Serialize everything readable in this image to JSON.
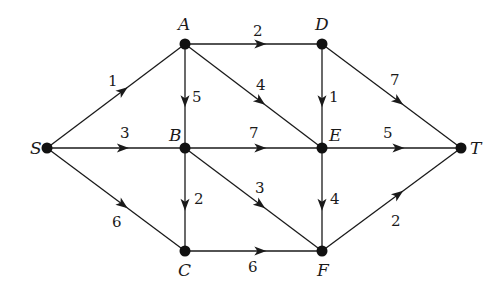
{
  "diagram": {
    "type": "directed-weighted-network",
    "nodes": [
      {
        "id": "S",
        "label": "S",
        "x": 47,
        "y": 148,
        "lx": 30,
        "ly": 154
      },
      {
        "id": "A",
        "label": "A",
        "x": 185,
        "y": 44,
        "lx": 178,
        "ly": 30
      },
      {
        "id": "B",
        "label": "B",
        "x": 185,
        "y": 148,
        "lx": 169,
        "ly": 141
      },
      {
        "id": "C",
        "label": "C",
        "x": 185,
        "y": 251,
        "lx": 178,
        "ly": 276
      },
      {
        "id": "D",
        "label": "D",
        "x": 322,
        "y": 44,
        "lx": 315,
        "ly": 30
      },
      {
        "id": "E",
        "label": "E",
        "x": 322,
        "y": 148,
        "lx": 329,
        "ly": 141
      },
      {
        "id": "F",
        "label": "F",
        "x": 322,
        "y": 251,
        "lx": 317,
        "ly": 276
      },
      {
        "id": "T",
        "label": "T",
        "x": 461,
        "y": 148,
        "lx": 470,
        "ly": 154
      }
    ],
    "edges": [
      {
        "from": "S",
        "to": "A",
        "weight": "1",
        "wx": 108,
        "wy": 86
      },
      {
        "from": "S",
        "to": "B",
        "weight": "3",
        "wx": 120,
        "wy": 138
      },
      {
        "from": "S",
        "to": "C",
        "weight": "6",
        "wx": 112,
        "wy": 227
      },
      {
        "from": "A",
        "to": "D",
        "weight": "2",
        "wx": 253,
        "wy": 36
      },
      {
        "from": "A",
        "to": "B",
        "weight": "5",
        "wx": 192,
        "wy": 102
      },
      {
        "from": "A",
        "to": "E",
        "weight": "4",
        "wx": 256,
        "wy": 90
      },
      {
        "from": "B",
        "to": "E",
        "weight": "7",
        "wx": 249,
        "wy": 138
      },
      {
        "from": "B",
        "to": "C",
        "weight": "2",
        "wx": 194,
        "wy": 204
      },
      {
        "from": "B",
        "to": "F",
        "weight": "3",
        "wx": 255,
        "wy": 193
      },
      {
        "from": "D",
        "to": "E",
        "weight": "1",
        "wx": 329,
        "wy": 102
      },
      {
        "from": "D",
        "to": "T",
        "weight": "7",
        "wx": 390,
        "wy": 85
      },
      {
        "from": "E",
        "to": "T",
        "weight": "5",
        "wx": 383,
        "wy": 138
      },
      {
        "from": "E",
        "to": "F",
        "weight": "4",
        "wx": 330,
        "wy": 204
      },
      {
        "from": "C",
        "to": "F",
        "weight": "6",
        "wx": 248,
        "wy": 272
      },
      {
        "from": "F",
        "to": "T",
        "weight": "2",
        "wx": 391,
        "wy": 226
      }
    ]
  }
}
